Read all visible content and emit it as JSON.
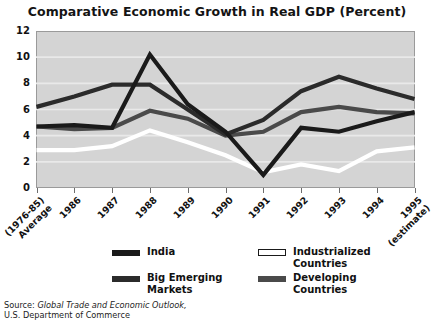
{
  "chart": {
    "title": "Comparative Economic Growth in Real GDP (Percent)"
  },
  "source": {
    "prefix": "Source: ",
    "italic_title": "Global Trade and Economic Outlook,",
    "line2": "U.S. Department of Commerce"
  },
  "legend": {
    "items": [
      {
        "label": "India",
        "swatch": "solid-black",
        "color": "#1a1a1a"
      },
      {
        "label_line1": "Industrialized",
        "label_line2": "Countries",
        "swatch": "white-outline",
        "color": "#ffffff"
      },
      {
        "label_line1": "Big Emerging",
        "label_line2": "Markets",
        "swatch": "dark-gray",
        "color": "#2b2b2b"
      },
      {
        "label_line1": "Developing",
        "label_line2": "Countries",
        "swatch": "mid-gray",
        "color": "#4a4a4a"
      }
    ]
  },
  "chart_data": {
    "type": "line",
    "title": "Comparative Economic Growth in Real GDP (Percent)",
    "xlabel": "",
    "ylabel": "",
    "ylim": [
      0,
      12
    ],
    "yticks": [
      0,
      2,
      4,
      6,
      8,
      10,
      12
    ],
    "grid": true,
    "legend_position": "bottom",
    "categories": [
      "(1976-85) Average",
      "1986",
      "1987",
      "1988",
      "1989",
      "1990",
      "1991",
      "1992",
      "1993",
      "1994",
      "1995 (estimate)"
    ],
    "category_lines": [
      [
        "(1976-85)",
        "Average"
      ],
      [
        "1986"
      ],
      [
        "1987"
      ],
      [
        "1988"
      ],
      [
        "1989"
      ],
      [
        "1990"
      ],
      [
        "1991"
      ],
      [
        "1992"
      ],
      [
        "1993"
      ],
      [
        "1994"
      ],
      [
        "1995",
        "(estimate)"
      ]
    ],
    "series": [
      {
        "name": "India",
        "color": "#1a1a1a",
        "values": [
          4.7,
          4.8,
          4.6,
          10.2,
          6.4,
          4.3,
          1.0,
          4.6,
          4.3,
          5.1,
          5.8
        ]
      },
      {
        "name": "Big Emerging Markets",
        "color": "#2b2b2b",
        "values": [
          6.2,
          7.0,
          7.9,
          7.9,
          6.0,
          4.1,
          5.2,
          7.4,
          8.5,
          7.6,
          6.8
        ]
      },
      {
        "name": "Developing Countries",
        "color": "#4a4a4a",
        "values": [
          4.7,
          4.5,
          4.6,
          5.9,
          5.3,
          4.0,
          4.3,
          5.8,
          6.2,
          5.8,
          5.7
        ]
      },
      {
        "name": "Industrialized Countries",
        "color": "#ffffff",
        "values": [
          2.9,
          2.9,
          3.2,
          4.4,
          3.5,
          2.5,
          1.2,
          1.8,
          1.3,
          2.8,
          3.1
        ]
      }
    ]
  }
}
